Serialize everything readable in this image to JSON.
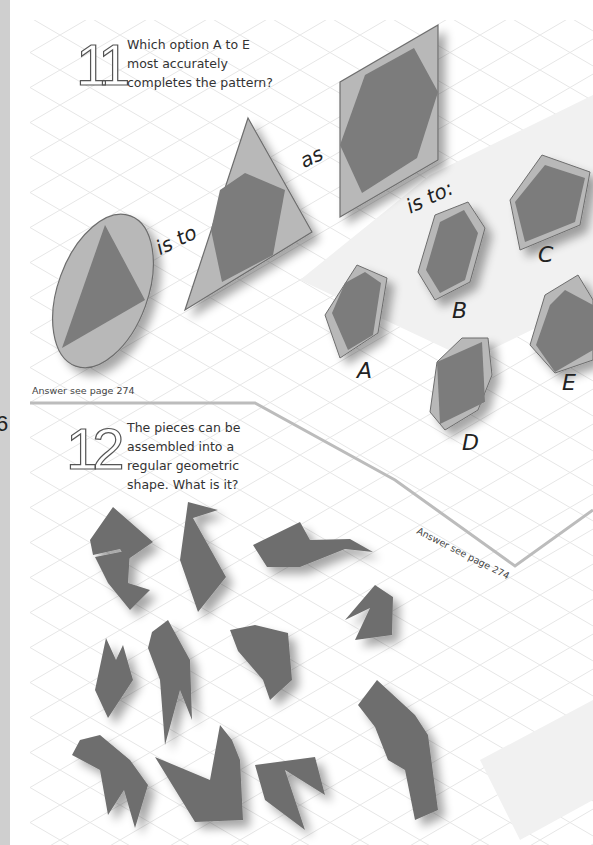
{
  "page": {
    "page_number_fragment": "6",
    "strip_color": "#cfcfcf",
    "colors": {
      "light_shape": "#b8b8b8",
      "dark_shape": "#7b7b7b",
      "outline": "#6d6d6d",
      "grid": "#e6e6e6"
    }
  },
  "puzzle11": {
    "number": "11",
    "question": [
      "Which option A to E",
      "most accurately",
      "completes the pattern?"
    ],
    "connectors": {
      "is_to": "is to",
      "as": "as",
      "is_to_colon": "is to:"
    },
    "options": [
      "A",
      "B",
      "C",
      "D",
      "E"
    ],
    "answer_ref": "Answer see page 274"
  },
  "puzzle12": {
    "number": "12",
    "question": [
      "The pieces can be",
      "assembled into a",
      "regular geometric",
      "shape. What is it?"
    ],
    "pieces_count": 12,
    "answer_ref": "Answer see page 274"
  }
}
